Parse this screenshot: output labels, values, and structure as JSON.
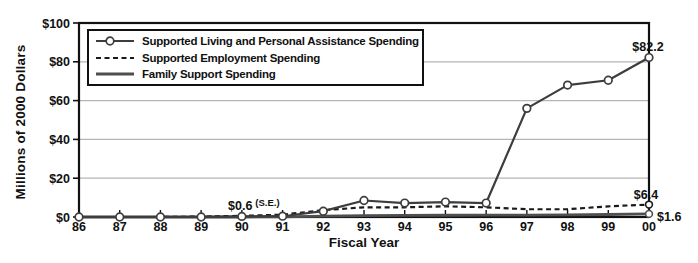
{
  "chart_data": {
    "type": "line",
    "title": "",
    "xlabel": "Fiscal Year",
    "ylabel": "Millions of 2000 Dollars",
    "x_tick_labels": [
      "86",
      "87",
      "88",
      "89",
      "90",
      "91",
      "92",
      "93",
      "94",
      "95",
      "96",
      "97",
      "98",
      "99",
      "00"
    ],
    "y_ticks": [
      0,
      20,
      40,
      60,
      80,
      100
    ],
    "y_tick_labels": [
      "$0",
      "$20",
      "$40",
      "$60",
      "$80",
      "$100"
    ],
    "ylim": [
      0,
      100
    ],
    "grid": "horizontal",
    "grid_color": "#b5b5b5",
    "axis_color": "#111111",
    "legend_position": "top-left-inside",
    "series": [
      {
        "name": "Supported Living and Personal Assistance Spending",
        "style": "solid",
        "markers": "open-circle-all-points",
        "color": "#3d3d3d",
        "values": [
          0,
          0,
          0,
          0,
          0.3,
          0.4,
          3,
          8.5,
          7.2,
          7.7,
          7.2,
          56,
          68,
          70.5,
          82.2
        ]
      },
      {
        "name": "Supported Employment Spending",
        "style": "dashed",
        "markers": "open-circle-last-point",
        "color": "#1a1a1a",
        "values": [
          0,
          0,
          0,
          0.2,
          0.6,
          1.2,
          3.5,
          5,
          5,
          5.5,
          5,
          4,
          4,
          5.5,
          6.4
        ]
      },
      {
        "name": "Family Support Spending",
        "style": "solid",
        "markers": "open-circle-last-point",
        "color": "#4f4f4f",
        "values": [
          0,
          0,
          0,
          0,
          0,
          0.1,
          0.4,
          0.7,
          0.8,
          0.9,
          1,
          1,
          1.1,
          1.3,
          1.6
        ]
      }
    ],
    "annotations": [
      {
        "text": "$82.2",
        "sup": "",
        "x": 648,
        "y": 51,
        "anchor": "middle"
      },
      {
        "text": "$0.6",
        "sup": "(S.E.)",
        "x": 228,
        "y": 210,
        "anchor": "start"
      },
      {
        "text": "$6.4",
        "sup": "",
        "x": 646,
        "y": 199,
        "anchor": "middle"
      },
      {
        "text": "$1.6",
        "sup": "",
        "x": 657,
        "y": 221,
        "anchor": "start"
      }
    ]
  }
}
